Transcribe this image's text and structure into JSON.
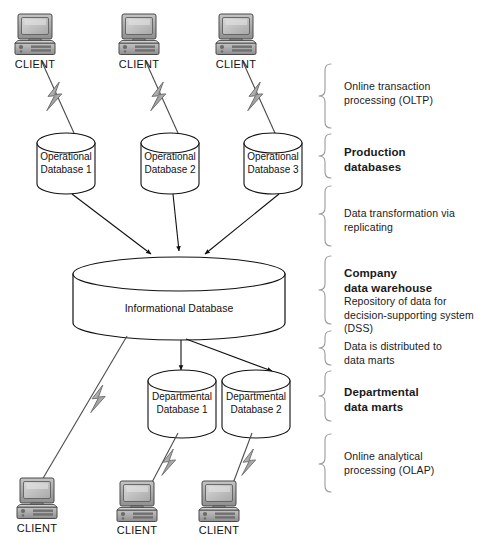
{
  "diagram": {
    "clients_top": [
      {
        "label": "CLIENT"
      },
      {
        "label": "CLIENT"
      },
      {
        "label": "CLIENT"
      }
    ],
    "clients_bottom": [
      {
        "label": "CLIENT"
      },
      {
        "label": "CLIENT"
      },
      {
        "label": "CLIENT"
      }
    ],
    "operational_databases": [
      {
        "line1": "Operational",
        "line2": "Database 1"
      },
      {
        "line1": "Operational",
        "line2": "Database 2"
      },
      {
        "line1": "Operational",
        "line2": "Database 3"
      }
    ],
    "warehouse": {
      "label": "Informational Database"
    },
    "departmental_databases": [
      {
        "line1": "Departmental",
        "line2": "Database 1"
      },
      {
        "line1": "Departmental",
        "line2": "Database 2"
      }
    ],
    "annotations": [
      {
        "id": "oltp",
        "bold": "",
        "lines": [
          "Online transaction",
          "processing (OLTP)"
        ]
      },
      {
        "id": "production-databases",
        "bold_lines": [
          "Production",
          "databases"
        ],
        "lines": []
      },
      {
        "id": "data-transformation",
        "bold": "",
        "lines": [
          "Data transformation via",
          "replicating"
        ]
      },
      {
        "id": "company-data-warehouse",
        "bold_lines": [
          "Company",
          "data warehouse"
        ],
        "lines": [
          "Repository of data for",
          "decision-supporting system",
          "(DSS)"
        ]
      },
      {
        "id": "data-distributed",
        "bold": "",
        "lines": [
          "Data is distributed to",
          "data marts"
        ]
      },
      {
        "id": "departmental-data-marts",
        "bold_lines": [
          "Departmental",
          "data marts"
        ],
        "lines": []
      },
      {
        "id": "olap",
        "bold": "",
        "lines": [
          "Online analytical",
          "processing (OLAP)"
        ]
      }
    ],
    "colors": {
      "line": "#111111",
      "brace": "#9a9a9a",
      "text": "#1a1a1a",
      "icon_dark": "#555555",
      "icon_mid": "#8d8d8d",
      "icon_light": "#c9c9c9",
      "bolt": "#b5b5b5"
    }
  }
}
